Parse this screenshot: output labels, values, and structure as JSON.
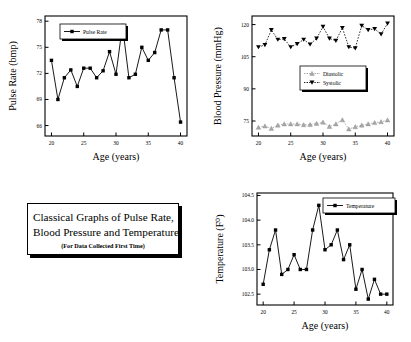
{
  "caption": {
    "line1": "Classical Graphs of Pulse Rate,",
    "line2": "Blood Pressure and Temperature",
    "subtitle": "(For Data Collected First Time)"
  },
  "chart_data": [
    {
      "id": "pulse",
      "type": "line",
      "title": "",
      "xlabel": "Age (years)",
      "ylabel": "Pulse Rate (bmp)",
      "xlim": [
        19,
        41
      ],
      "ylim": [
        64.8,
        78.6
      ],
      "xticks": [
        20,
        25,
        30,
        35,
        40
      ],
      "yticks": [
        66,
        69,
        72,
        75,
        78
      ],
      "grid": false,
      "legend": [
        "Pulse Rate"
      ],
      "legend_position": "top-left",
      "marker": "square",
      "color": "#000000",
      "x": [
        20,
        21,
        22,
        23,
        24,
        25,
        26,
        27,
        28,
        29,
        30,
        31,
        32,
        33,
        34,
        35,
        36,
        37,
        38,
        39,
        40
      ],
      "series": [
        {
          "name": "Pulse Rate",
          "values": [
            73.5,
            69.0,
            71.5,
            72.4,
            70.5,
            72.6,
            72.6,
            71.5,
            72.3,
            74.5,
            71.9,
            77.5,
            71.5,
            71.9,
            75.0,
            73.5,
            74.4,
            77.0,
            77.0,
            71.5,
            66.4
          ]
        }
      ]
    },
    {
      "id": "bloodpressure",
      "type": "line",
      "title": "",
      "xlabel": "Age (years)",
      "ylabel": "Blood Pressure (mmHg)",
      "xlim": [
        19,
        41
      ],
      "ylim": [
        68,
        124
      ],
      "xticks": [
        20,
        25,
        30,
        35,
        40
      ],
      "yticks": [
        75,
        90,
        105,
        120
      ],
      "grid": false,
      "legend": [
        "Diastolic",
        "Systolic"
      ],
      "legend_position": "center",
      "x": [
        20,
        21,
        22,
        23,
        24,
        25,
        26,
        27,
        28,
        29,
        30,
        31,
        32,
        33,
        34,
        35,
        36,
        37,
        38,
        39,
        40
      ],
      "series": [
        {
          "name": "Diastolic",
          "marker": "triangle-up",
          "color": "#a8a8a8",
          "values": [
            72.0,
            72.6,
            71.5,
            73.0,
            73.6,
            73.6,
            73.6,
            73.2,
            73.3,
            73.8,
            74.4,
            72.4,
            73.6,
            75.5,
            71.2,
            72.3,
            73.0,
            73.6,
            74.2,
            74.6,
            75.4
          ]
        },
        {
          "name": "Systolic",
          "marker": "triangle-down",
          "color": "#000000",
          "values": [
            109.5,
            110.5,
            117.5,
            113.0,
            113.3,
            109.5,
            111.0,
            113.0,
            110.8,
            113.5,
            119.0,
            113.5,
            112.5,
            118.5,
            109.5,
            109.0,
            119.5,
            117.5,
            118.0,
            115.5,
            120.5
          ]
        }
      ]
    },
    {
      "id": "temperature",
      "type": "line",
      "title": "",
      "xlabel": "Age (years)",
      "ylabel": "Temperature (F⁰)",
      "xlim": [
        19,
        41
      ],
      "ylim": [
        102.28,
        104.55
      ],
      "xticks": [
        20,
        25,
        30,
        35,
        40
      ],
      "yticks": [
        "102.5",
        "103.0",
        "103.5",
        "104.0",
        "104.5"
      ],
      "ytickvals": [
        102.5,
        103.0,
        103.5,
        104.0,
        104.5
      ],
      "grid": false,
      "legend": [
        "Temperature"
      ],
      "legend_position": "top-right",
      "marker": "square",
      "color": "#000000",
      "x": [
        20,
        21,
        22,
        23,
        24,
        25,
        26,
        27,
        28,
        29,
        30,
        31,
        32,
        33,
        34,
        35,
        36,
        37,
        38,
        39,
        40
      ],
      "series": [
        {
          "name": "Temperature",
          "values": [
            102.7,
            103.4,
            103.8,
            102.9,
            103.0,
            103.3,
            103.0,
            103.0,
            103.8,
            104.3,
            103.4,
            103.5,
            103.8,
            103.2,
            103.5,
            102.6,
            103.0,
            102.4,
            102.8,
            102.5,
            102.5
          ]
        }
      ]
    }
  ]
}
